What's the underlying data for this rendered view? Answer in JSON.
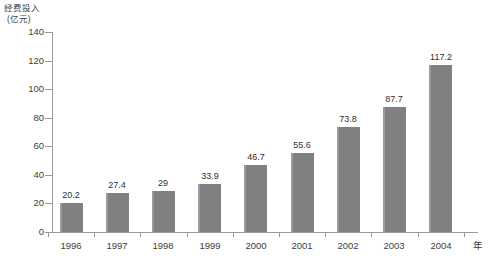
{
  "chart_data": {
    "type": "bar",
    "title": "",
    "ylabel": "经费投入",
    "yunit": "(亿元)",
    "xlabel": "年",
    "categories": [
      "1996",
      "1997",
      "1998",
      "1999",
      "2000",
      "2001",
      "2002",
      "2003",
      "2004"
    ],
    "values": [
      20.2,
      27.4,
      29,
      33.9,
      46.7,
      55.6,
      73.8,
      87.7,
      117.2
    ],
    "value_labels": [
      "20.2",
      "27.4",
      "29",
      "33.9",
      "46.7",
      "55.6",
      "73.8",
      "87.7",
      "117.2"
    ],
    "ylim": [
      0,
      140
    ],
    "ytick_labels": [
      "0",
      "20",
      "40",
      "60",
      "80",
      "100",
      "120",
      "140"
    ],
    "ytick_values": [
      0,
      20,
      40,
      60,
      80,
      100,
      120,
      140
    ],
    "grid": false,
    "legend": "none",
    "bar_color": "#808080",
    "axis_color": "#9a9a9a",
    "text_color": "#3d3d3d"
  }
}
